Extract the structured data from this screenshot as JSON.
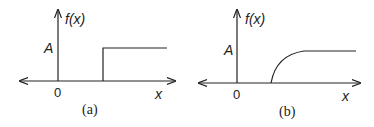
{
  "figure": {
    "panels": [
      {
        "caption": "(a)",
        "y_label": "f(x)",
        "x_label": "x",
        "origin_label": "0",
        "level_label": "A",
        "shape": "step"
      },
      {
        "caption": "(b)",
        "y_label": "f(x)",
        "x_label": "x",
        "origin_label": "0",
        "level_label": "A",
        "shape": "smooth rise to plateau"
      }
    ]
  },
  "colors": {
    "line": "#222222",
    "background": "#ffffff"
  }
}
